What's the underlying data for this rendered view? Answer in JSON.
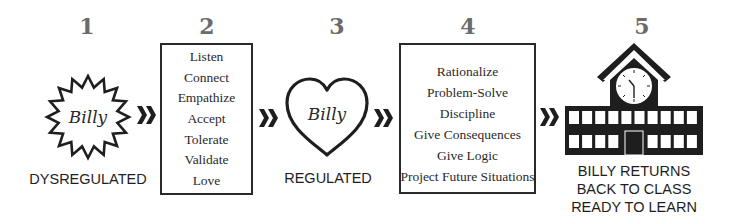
{
  "colors": {
    "ink": "#1e1e1e",
    "step_number": "#6b6b6b"
  },
  "steps": [
    {
      "number": "1",
      "icon": "starburst-icon",
      "icon_text": "Billy",
      "caption": "DYSREGULATED"
    },
    {
      "number": "2",
      "items": [
        "Listen",
        "Connect",
        "Empathize",
        "Accept",
        "Tolerate",
        "Validate",
        "Love"
      ]
    },
    {
      "number": "3",
      "icon": "heart-icon",
      "icon_text": "Billy",
      "caption": "REGULATED"
    },
    {
      "number": "4",
      "items": [
        "Rationalize",
        "Problem-Solve",
        "Discipline",
        "Give Consequences",
        "Give Logic",
        "Project Future Situations"
      ]
    },
    {
      "number": "5",
      "icon": "school-building-icon",
      "caption_lines": [
        "BILLY RETURNS",
        "BACK TO CLASS",
        "READY TO LEARN"
      ]
    }
  ],
  "connectors": [
    "double-chevron-right",
    "double-chevron-right",
    "double-chevron-right",
    "double-chevron-right"
  ]
}
